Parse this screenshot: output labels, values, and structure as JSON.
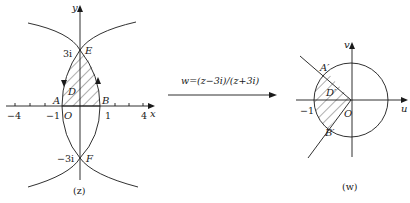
{
  "z_plane": {
    "axis_x_label": "x",
    "axis_y_label": "y",
    "origin_label": "O",
    "tick_labels": {
      "minus4": "−4",
      "minus1": "−1",
      "plus1": "1",
      "plus4": "4"
    },
    "imag_top": "3i",
    "imag_bottom": "−3i",
    "points": {
      "A": "A",
      "B": "B",
      "E": "E",
      "F": "F"
    },
    "region_label": "D",
    "plane_label": "(z)"
  },
  "mapping": {
    "formula": "w=(z−3i)/(z+3i)"
  },
  "w_plane": {
    "axis_u_label": "u",
    "axis_v_label": "v",
    "origin_label": "O",
    "tick_minus1": "−1",
    "points": {
      "A_prime": "A′",
      "B_prime": "B′"
    },
    "region_label": "D′",
    "plane_label": "(w)"
  },
  "colors": {
    "ink": "#1a1a1a",
    "background": "#ffffff"
  }
}
